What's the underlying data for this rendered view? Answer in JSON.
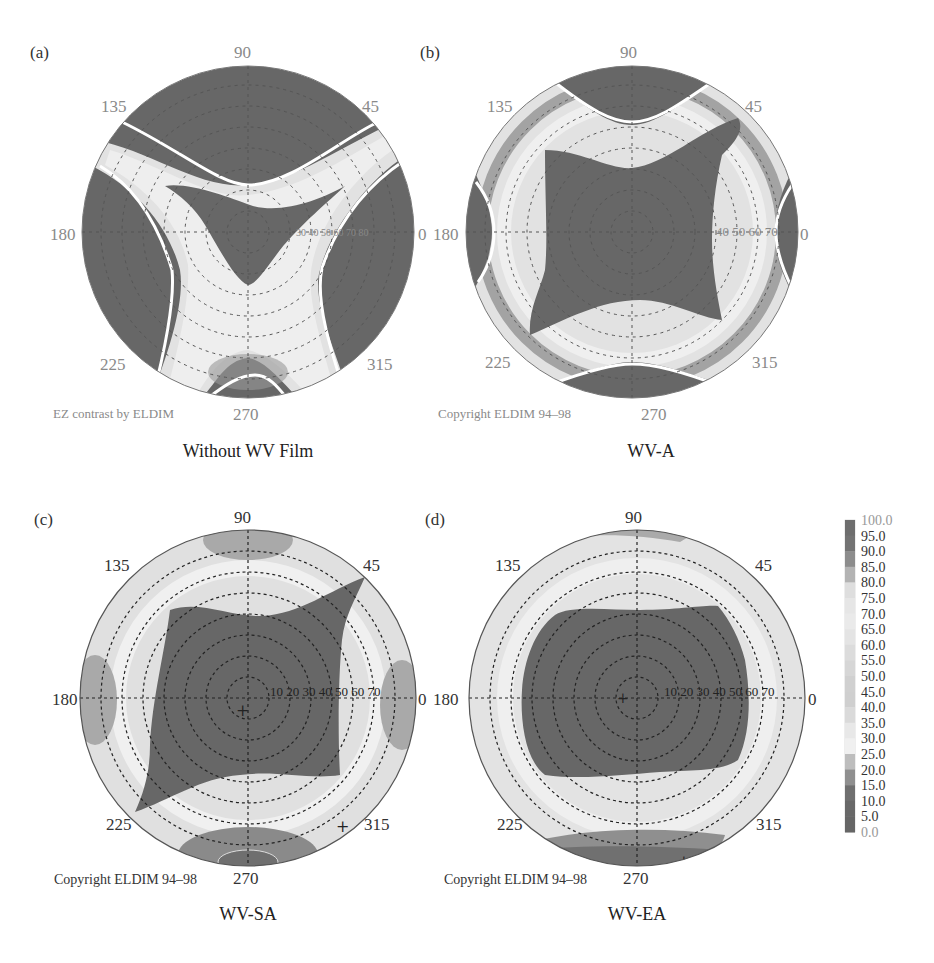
{
  "figure": {
    "panels": [
      {
        "letter": "(a)",
        "caption": "Without WV Film",
        "watermark": "EZ contrast by ELDIM",
        "cx": 248,
        "cy": 232,
        "r": 168
      },
      {
        "letter": "(b)",
        "caption": "WV-A",
        "watermark": "Copyright ELDIM 94–98",
        "cx": 632,
        "cy": 232,
        "r": 168
      },
      {
        "letter": "(c)",
        "caption": "WV-SA",
        "watermark": "Copyright ELDIM 94–98",
        "cx": 248,
        "cy": 698,
        "r": 168
      },
      {
        "letter": "(d)",
        "caption": "WV-EA",
        "watermark": "Copyright ELDIM 94–98",
        "cx": 637,
        "cy": 698,
        "r": 168
      }
    ],
    "azimuth_labels": [
      "0",
      "45",
      "90",
      "135",
      "180",
      "225",
      "270",
      "315"
    ],
    "radial_labels_ab": [
      "40",
      "50",
      "60",
      "70"
    ],
    "radial_labels_cd": [
      "10",
      "20",
      "30",
      "40",
      "50",
      "60",
      "70"
    ],
    "colorbar": {
      "ticks": [
        "100.0",
        "95.0",
        "90.0",
        "85.0",
        "80.0",
        "75.0",
        "70.0",
        "65.0",
        "60.0",
        "55.0",
        "50.0",
        "45.0",
        "40.0",
        "35.0",
        "30.0",
        "25.0",
        "20.0",
        "15.0",
        "10.0",
        "5.0",
        "0.0"
      ],
      "colors": [
        "#6e6e6e",
        "#737373",
        "#8c8c8c",
        "#b3b3b3",
        "#dedede",
        "#e6e6e6",
        "#eaeaea",
        "#e4e4e4",
        "#dcdcdc",
        "#d6d6d6",
        "#d0d0d0",
        "#cfcfcf",
        "#dadada",
        "#e8e8e8",
        "#f0f0f0",
        "#bdbdbd",
        "#8f8f8f",
        "#6f6f6f",
        "#686868",
        "#666666"
      ]
    },
    "colors": {
      "dark": "#676767",
      "light": "#e6e6e6",
      "mid": "#a8a8a8",
      "text": "#333333",
      "grey_text": "#8a8a8a"
    }
  },
  "chart_data": {
    "type": "heatmap",
    "subplots": [
      {
        "label": "(a)",
        "name": "Without WV Film",
        "description": "High contrast (dark) regions only in X-shaped band; low contrast zones at top, left, right and bottom",
        "white_contour": "CR=10 boundary lines"
      },
      {
        "label": "(b)",
        "name": "WV-A",
        "description": "Large concave-square high-contrast central region; low contrast at top/bottom and left/right edges"
      },
      {
        "label": "(c)",
        "name": "WV-SA",
        "description": "Concave-square high-contrast region extending to 45/225 diagonals"
      },
      {
        "label": "(d)",
        "name": "WV-EA",
        "description": "Rounded rectangle high-contrast region up to ~50 deg polar angle"
      }
    ],
    "polar_axis": {
      "azimuth_deg": [
        0,
        45,
        90,
        135,
        180,
        225,
        270,
        315
      ],
      "polar_rings_deg": [
        10,
        20,
        30,
        40,
        50,
        60,
        70,
        80
      ]
    },
    "colorbar": {
      "min": 0.0,
      "max": 100.0,
      "step": 5.0,
      "label": "Contrast ratio"
    }
  }
}
